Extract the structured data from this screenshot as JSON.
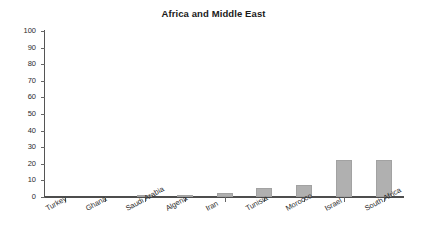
{
  "chart_data": {
    "type": "bar",
    "title": "Africa and Middle East",
    "xlabel": "",
    "ylabel": "",
    "ylim": [
      0,
      100
    ],
    "yticks": [
      0,
      10,
      20,
      30,
      40,
      50,
      60,
      70,
      80,
      90,
      100
    ],
    "grid": false,
    "legend": "none",
    "bar_color": "#b0b0b0",
    "categories": [
      "Turkey",
      "Ghana",
      "Saudi Arabia",
      "Algeria",
      "Iran",
      "Tunisia",
      "Morocco",
      "Israel",
      "South Africa"
    ],
    "values": [
      0,
      0,
      1,
      1,
      2.5,
      5.5,
      7,
      22,
      22
    ]
  }
}
